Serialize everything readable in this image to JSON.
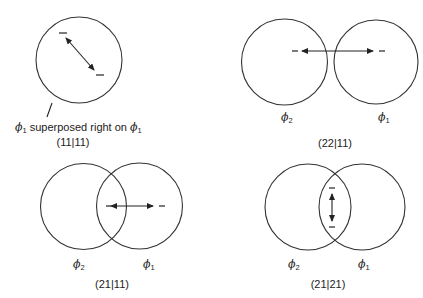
{
  "panels": [
    {
      "id": "top-left",
      "caption_prefix": "ϕ",
      "caption_sub1": "1",
      "caption_mid": " superposed right on ",
      "caption_suffix": "ϕ",
      "caption_sub2": "1",
      "notation": "(11|11)"
    },
    {
      "id": "top-right",
      "left_label": "ϕ",
      "left_sub": "2",
      "right_label": "ϕ",
      "right_sub": "1",
      "notation": "(22|11)"
    },
    {
      "id": "bottom-left",
      "left_label": "ϕ",
      "left_sub": "2",
      "right_label": "ϕ",
      "right_sub": "1",
      "notation": "(21|11)"
    },
    {
      "id": "bottom-right",
      "left_label": "ϕ",
      "left_sub": "2",
      "right_label": "ϕ",
      "right_sub": "1",
      "notation": "(21|21)"
    }
  ]
}
